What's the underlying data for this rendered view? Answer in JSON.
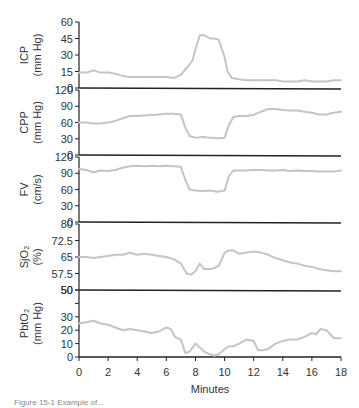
{
  "chart_data": {
    "type": "line",
    "title": "",
    "xlabel": "Minutes",
    "x_ticks": [
      0,
      2,
      4,
      6,
      8,
      10,
      12,
      14,
      16,
      18
    ],
    "xlim": [
      0,
      18
    ],
    "grid": false,
    "legend": "none",
    "line_color": "#c4c4c4",
    "panels": [
      {
        "name": "ICP",
        "ylabel_line1": "ICP",
        "ylabel_line2": "(mm Hg)",
        "ylim": [
          0,
          60
        ],
        "y_ticks": [
          0,
          15,
          30,
          45,
          60
        ],
        "y_tick_labels": [
          "0",
          "15",
          "30",
          "45",
          "60"
        ],
        "x": [
          0,
          0.5,
          1,
          1.5,
          2,
          2.5,
          3,
          3.5,
          4,
          4.5,
          5,
          5.5,
          6,
          6.5,
          7,
          7.5,
          7.8,
          8,
          8.3,
          8.6,
          9,
          9.3,
          9.6,
          10,
          10.2,
          10.5,
          11,
          11.5,
          12,
          12.5,
          13,
          13.5,
          14,
          14.5,
          15,
          15.5,
          16,
          16.5,
          17,
          17.5,
          18
        ],
        "values": [
          14,
          14,
          16,
          14,
          14,
          13,
          11,
          10,
          10,
          10,
          10,
          10,
          10,
          9,
          12,
          20,
          25,
          35,
          48,
          48,
          45,
          45,
          44,
          28,
          15,
          9,
          8,
          7,
          7,
          7,
          7,
          7,
          6,
          6,
          6,
          7,
          6,
          6,
          6,
          7,
          7
        ]
      },
      {
        "name": "CPP",
        "ylabel_line1": "CPP",
        "ylabel_line2": "(mm Hg)",
        "ylim": [
          0,
          120
        ],
        "y_ticks": [
          0,
          30,
          60,
          90,
          120
        ],
        "y_tick_labels": [
          "0",
          "30",
          "60",
          "90",
          "120"
        ],
        "x": [
          0,
          0.5,
          1,
          1.5,
          2,
          2.5,
          3,
          3.5,
          4,
          4.5,
          5,
          5.5,
          6,
          6.5,
          7,
          7.3,
          7.6,
          8,
          8.5,
          9,
          9.5,
          10,
          10.3,
          10.6,
          11,
          11.5,
          12,
          12.5,
          13,
          13.5,
          14,
          14.5,
          15,
          15.5,
          16,
          16.5,
          17,
          17.5,
          18
        ],
        "values": [
          60,
          60,
          58,
          58,
          60,
          63,
          68,
          72,
          72,
          73,
          74,
          75,
          76,
          76,
          75,
          50,
          35,
          32,
          33,
          32,
          31,
          32,
          55,
          70,
          72,
          72,
          74,
          80,
          85,
          85,
          83,
          82,
          82,
          80,
          78,
          75,
          75,
          78,
          80
        ]
      },
      {
        "name": "FV",
        "ylabel_line1": "FV",
        "ylabel_line2": "(cm/s)",
        "ylim": [
          0,
          120
        ],
        "y_ticks": [
          0,
          30,
          60,
          90,
          120
        ],
        "y_tick_labels": [
          "0",
          "30",
          "60",
          "90",
          "120"
        ],
        "x": [
          0,
          0.5,
          1,
          1.5,
          2,
          2.5,
          3,
          3.5,
          4,
          4.5,
          5,
          5.5,
          6,
          6.5,
          7,
          7.3,
          7.6,
          8,
          8.5,
          9,
          9.5,
          10,
          10.3,
          10.6,
          11,
          11.5,
          12,
          12.5,
          13,
          13.5,
          14,
          14.5,
          15,
          15.5,
          16,
          16.5,
          17,
          17.5,
          18
        ],
        "values": [
          98,
          96,
          92,
          95,
          94,
          96,
          100,
          103,
          104,
          103,
          104,
          103,
          104,
          103,
          102,
          78,
          60,
          58,
          57,
          58,
          56,
          58,
          85,
          95,
          95,
          95,
          96,
          96,
          95,
          95,
          96,
          94,
          95,
          94,
          94,
          93,
          93,
          93,
          95
        ]
      },
      {
        "name": "SjO2",
        "ylabel_line1": "SjO₂",
        "ylabel_line2": "(%)",
        "ylim": [
          50,
          80
        ],
        "y_ticks": [
          50,
          57.5,
          65,
          72.5,
          80
        ],
        "y_tick_labels": [
          "50",
          "57.5",
          "65",
          "72.5",
          "80"
        ],
        "x": [
          0,
          0.5,
          1,
          1.5,
          2,
          2.5,
          3,
          3.5,
          4,
          4.5,
          5,
          5.5,
          6,
          6.5,
          7,
          7.4,
          7.7,
          8,
          8.3,
          8.6,
          9,
          9.3,
          9.6,
          10,
          10.3,
          10.6,
          11,
          11.5,
          12,
          12.5,
          13,
          13.5,
          14,
          14.5,
          15,
          15.5,
          16,
          16.5,
          17,
          17.5,
          18
        ],
        "values": [
          65,
          65,
          64.5,
          65,
          65.5,
          66,
          66,
          67,
          66,
          66.5,
          66,
          65.5,
          65,
          64,
          62,
          57.5,
          57,
          58.5,
          62,
          59.5,
          59.5,
          60,
          61,
          67,
          68,
          68,
          66.5,
          67,
          67.5,
          67,
          66,
          64.5,
          63.5,
          62.5,
          62,
          61,
          60.5,
          59.5,
          59,
          58.5,
          58.5
        ]
      },
      {
        "name": "PbtO2",
        "ylabel_line1": "PbtO₂",
        "ylabel_line2": "(mm Hg)",
        "ylim": [
          0,
          50
        ],
        "y_ticks": [
          0,
          10,
          20,
          30,
          40,
          50
        ],
        "y_tick_labels": [
          "0",
          "10",
          "20",
          "30",
          "",
          "50"
        ],
        "x": [
          0,
          0.5,
          1,
          1.5,
          2,
          2.5,
          3,
          3.5,
          4,
          4.5,
          5,
          5.5,
          6,
          6.3,
          6.6,
          7,
          7.3,
          7.6,
          8,
          8.3,
          8.6,
          9,
          9.3,
          9.6,
          10,
          10.3,
          10.6,
          11,
          11.5,
          12,
          12.3,
          12.6,
          13,
          13.5,
          14,
          14.5,
          15,
          15.5,
          16,
          16.3,
          16.6,
          17,
          17.5,
          18
        ],
        "values": [
          25,
          26,
          27,
          25,
          24,
          22,
          20,
          21,
          20,
          19,
          18,
          19,
          22,
          21,
          15,
          13,
          3,
          4,
          10,
          7,
          4,
          2,
          1,
          2,
          6,
          8,
          8,
          10,
          13,
          12,
          5,
          5,
          6,
          10,
          12,
          13,
          13,
          15,
          18,
          17,
          21,
          20,
          14,
          14
        ]
      }
    ]
  },
  "caption": "Figure 15-1  Example of..."
}
